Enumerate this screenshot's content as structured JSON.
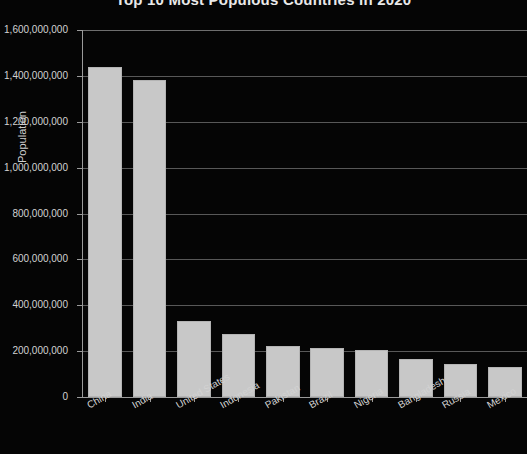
{
  "chart_data": {
    "type": "bar",
    "title": "Top 10 Most Populous Countries in 2020",
    "xlabel": "",
    "ylabel": "Population",
    "ylim": [
      0,
      1600000000
    ],
    "grid": true,
    "legend": "none",
    "categories": [
      "China",
      "India",
      "United States",
      "Indonesia",
      "Pakistan",
      "Brazil",
      "Nigeria",
      "Bangladesh",
      "Russia",
      "Mexico"
    ],
    "values": [
      1439323776,
      1380004385,
      331002651,
      273523615,
      220892340,
      212559417,
      206139589,
      164689383,
      145934462,
      128932753
    ],
    "ytick_labels": [
      "0",
      "200,000,000",
      "400,000,000",
      "600,000,000",
      "800,000,000",
      "1,000,000,000",
      "1,200,000,000",
      "1,400,000,000",
      "1,600,000,000"
    ],
    "ytick_values": [
      0,
      200000000,
      400000000,
      600000000,
      800000000,
      1000000000,
      1200000000,
      1400000000,
      1600000000
    ],
    "colors": {
      "background": "#050505",
      "bar_fill": "#c8c8c8",
      "bar_edge": "#b4b4b4",
      "gridline": "#6e6e6e",
      "axis": "#9a9a9a",
      "text": "#d2d2d2",
      "title": "#e9e9e9"
    }
  }
}
